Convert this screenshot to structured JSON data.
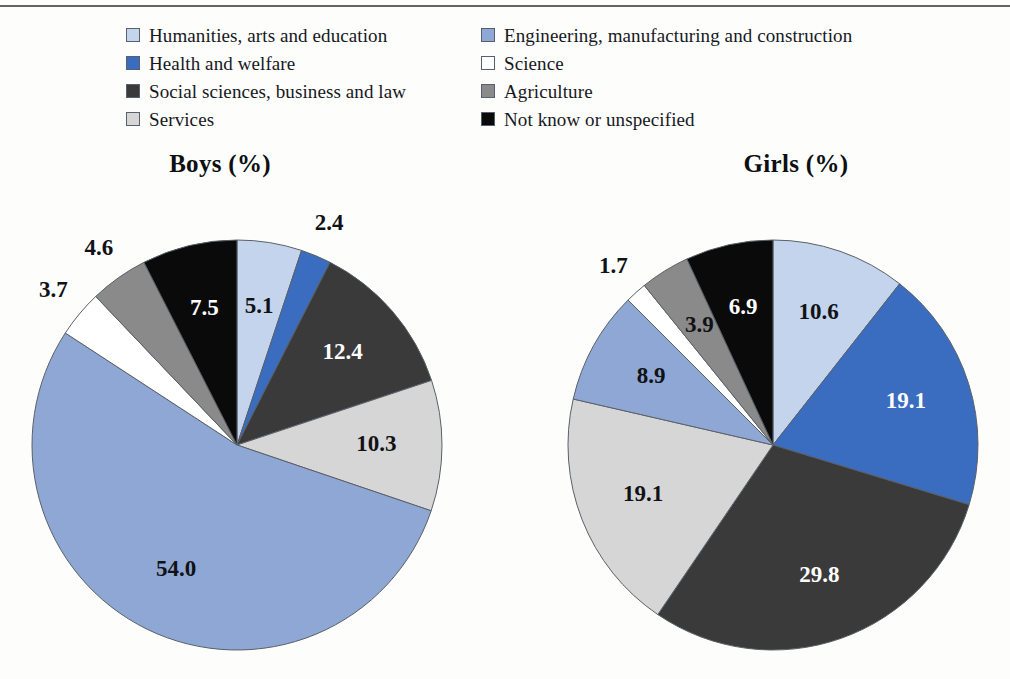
{
  "legend": {
    "columns": [
      {
        "items": [
          {
            "label": "Humanities, arts and education",
            "color": "#c3d4ec",
            "swatch_name": "swatch-humanities"
          },
          {
            "label": "Health and welfare",
            "color": "#3a6cbf",
            "swatch_name": "swatch-health"
          },
          {
            "label": "Social sciences, business and law",
            "color": "#3a3a3a",
            "swatch_name": "swatch-social"
          },
          {
            "label": "Services",
            "color": "#d6d6d6",
            "swatch_name": "swatch-services"
          }
        ]
      },
      {
        "items": [
          {
            "label": "Engineering, manufacturing and construction",
            "color": "#8fa7d4",
            "swatch_name": "swatch-engineering"
          },
          {
            "label": "Science",
            "color": "#ffffff",
            "swatch_name": "swatch-science"
          },
          {
            "label": "Agriculture",
            "color": "#8a8a8a",
            "swatch_name": "swatch-agriculture"
          },
          {
            "label": "Not know or unspecified",
            "color": "#0a0a0a",
            "swatch_name": "swatch-not-known"
          }
        ]
      }
    ]
  },
  "chart_data": [
    {
      "type": "pie",
      "title": "Boys (%)",
      "categories": [
        "Humanities, arts and education",
        "Health and welfare",
        "Social sciences, business and law",
        "Services",
        "Engineering, manufacturing and construction",
        "Science",
        "Agriculture",
        "Not know or unspecified"
      ],
      "values": [
        5.1,
        2.4,
        12.4,
        10.3,
        54.0,
        3.7,
        4.6,
        7.5
      ],
      "labels": [
        "5.1",
        "2.4",
        "12.4",
        "10.3",
        "54.0",
        "3.7",
        "4.6",
        "7.5"
      ],
      "colors": [
        "#c3d4ec",
        "#3a6cbf",
        "#3a3a3a",
        "#d6d6d6",
        "#8fa7d4",
        "#ffffff",
        "#8a8a8a",
        "#0a0a0a"
      ],
      "label_colors": [
        "dark",
        "dark",
        "light",
        "dark",
        "dark",
        "dark",
        "dark",
        "light"
      ],
      "label_outside": [
        false,
        true,
        false,
        false,
        false,
        true,
        true,
        false
      ],
      "start_angle": 0,
      "direction": "clockwise",
      "legend_position": "top",
      "center": [
        237,
        250
      ],
      "radius": 205
    },
    {
      "type": "pie",
      "title": "Girls (%)",
      "categories": [
        "Humanities, arts and education",
        "Health and welfare",
        "Social sciences, business and law",
        "Services",
        "Engineering, manufacturing and construction",
        "Science",
        "Agriculture",
        "Not know or unspecified"
      ],
      "values": [
        10.6,
        19.1,
        29.8,
        19.1,
        8.9,
        1.7,
        3.9,
        6.9
      ],
      "labels": [
        "10.6",
        "19.1",
        "29.8",
        "19.1",
        "8.9",
        "1.7",
        "3.9",
        "6.9"
      ],
      "colors": [
        "#c3d4ec",
        "#3a6cbf",
        "#3a3a3a",
        "#d6d6d6",
        "#8fa7d4",
        "#ffffff",
        "#8a8a8a",
        "#0a0a0a"
      ],
      "label_colors": [
        "dark",
        "light",
        "light",
        "dark",
        "dark",
        "dark",
        "dark",
        "light"
      ],
      "label_outside": [
        false,
        false,
        false,
        false,
        false,
        true,
        false,
        false
      ],
      "start_angle": 0,
      "direction": "clockwise",
      "legend_position": "top",
      "center": [
        253,
        250
      ],
      "radius": 205
    }
  ]
}
